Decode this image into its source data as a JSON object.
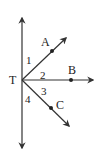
{
  "diagram": {
    "vertex": {
      "label": "T",
      "x": 22,
      "y": 80
    },
    "line_color": "#333333",
    "vertical_line": {
      "x": 22,
      "y_top": 18,
      "y_bottom": 148
    },
    "rays": [
      {
        "name": "A",
        "end_x": 66,
        "end_y": 38,
        "point_x": 52,
        "point_y": 51,
        "label_x": 41,
        "label_y": 46
      },
      {
        "name": "B",
        "end_x": 93,
        "end_y": 80,
        "point_x": 71,
        "point_y": 80,
        "label_x": 67,
        "label_y": 74
      },
      {
        "name": "C",
        "end_x": 69,
        "end_y": 126,
        "point_x": 51,
        "point_y": 108,
        "label_x": 56,
        "label_y": 109
      }
    ],
    "angle_labels": [
      {
        "text": "1",
        "x": 26,
        "y": 64
      },
      {
        "text": "2",
        "x": 40,
        "y": 79
      },
      {
        "text": "3",
        "x": 41,
        "y": 95
      },
      {
        "text": "4",
        "x": 25,
        "y": 102
      }
    ],
    "labels": {
      "vertex": "T",
      "a": "A",
      "b": "B",
      "c": "C",
      "angle1": "1",
      "angle2": "2",
      "angle3": "3",
      "angle4": "4"
    }
  }
}
